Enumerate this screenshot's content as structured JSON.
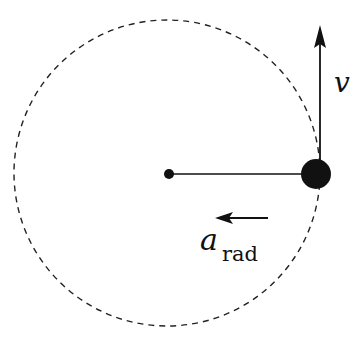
{
  "diagram": {
    "path": {
      "type": "dashed-circle",
      "cx": 167,
      "cy": 173,
      "r": 153
    },
    "center_point": {
      "cx": 169,
      "cy": 174,
      "r": 5
    },
    "particle": {
      "cx": 316,
      "cy": 174,
      "r": 15
    },
    "radius_line": {
      "x1": 169,
      "y1": 174,
      "x2": 316,
      "y2": 174
    },
    "vectors": [
      {
        "id": "velocity",
        "label": "v",
        "direction": "up",
        "x1": 320,
        "y1": 165,
        "x2": 320,
        "y2": 25
      },
      {
        "id": "radial-acceleration",
        "label": "a",
        "subscript": "rad",
        "direction": "left",
        "x1": 268,
        "y1": 218,
        "x2": 215,
        "y2": 218
      }
    ],
    "colors": {
      "ink": "#111111",
      "background": "#ffffff"
    }
  }
}
